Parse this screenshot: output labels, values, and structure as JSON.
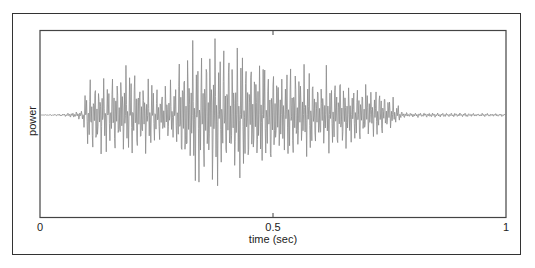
{
  "chart_data": {
    "type": "line",
    "title": "",
    "xlabel": "time (sec)",
    "ylabel": "power",
    "xlim": [
      0,
      1
    ],
    "x_ticks": [
      0,
      0.5,
      1
    ],
    "x_tick_labels": [
      "0",
      "0.5",
      "1"
    ],
    "y_ticks": [],
    "grid": false,
    "legend": null,
    "series": [
      {
        "name": "speech waveform",
        "color": "#8a8a8a",
        "description": "Oscillating audio waveform centered at zero; near-silent until ~0.05 s, onset ~0.1 s, peak amplitude ~0.3-0.45 s, decays to near-silence by ~0.78 s",
        "envelope": {
          "t": [
            0.0,
            0.05,
            0.09,
            0.1,
            0.14,
            0.2,
            0.25,
            0.29,
            0.3,
            0.35,
            0.4,
            0.45,
            0.55,
            0.65,
            0.72,
            0.75,
            0.78,
            0.85,
            1.0
          ],
          "upper": [
            0.0,
            0.02,
            0.06,
            0.45,
            0.6,
            0.65,
            0.45,
            0.45,
            0.85,
            1.0,
            0.98,
            0.9,
            0.7,
            0.55,
            0.45,
            0.3,
            0.04,
            0.03,
            0.02
          ],
          "lower": [
            0.0,
            0.02,
            0.06,
            0.45,
            0.55,
            0.6,
            0.4,
            0.4,
            0.8,
            0.95,
            0.95,
            0.85,
            0.6,
            0.45,
            0.35,
            0.2,
            0.04,
            0.03,
            0.02
          ]
        }
      }
    ]
  },
  "axes": {
    "x_tick_labels": [
      "0",
      "0.5",
      "1"
    ],
    "xlabel": "time (sec)",
    "ylabel": "power"
  }
}
